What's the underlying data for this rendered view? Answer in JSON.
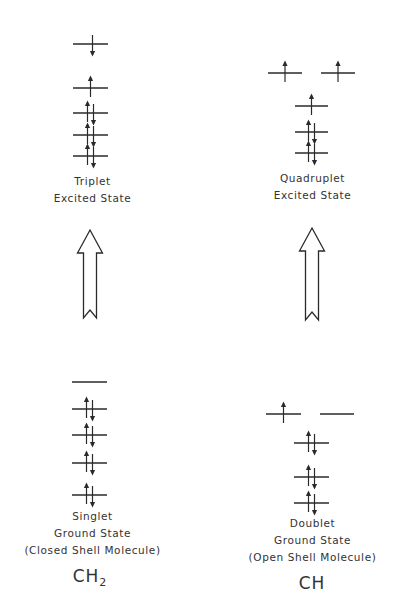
{
  "diagram": {
    "type": "energy-level electron configuration comparison",
    "line_color": "#2a2a2a",
    "columns": [
      {
        "molecule": "CH",
        "molecule_main": "CH",
        "molecule_sub": "2",
        "excited_state": {
          "label_lines": [
            "Triplet",
            "Excited State"
          ],
          "levels": [
            {
              "y": 44,
              "x1": 73,
              "x2": 108,
              "electrons": "down"
            },
            {
              "y": 88,
              "x1": 73,
              "x2": 108,
              "electrons": "up"
            },
            {
              "y": 113,
              "x1": 73,
              "x2": 108,
              "electrons": "pair"
            },
            {
              "y": 135,
              "x1": 73,
              "x2": 108,
              "electrons": "pair"
            },
            {
              "y": 156,
              "x1": 73,
              "x2": 108,
              "electrons": "pair"
            }
          ]
        },
        "transition_arrow": {
          "x": 90,
          "top": 230,
          "bottom": 318
        },
        "ground_state": {
          "label_lines": [
            "Singlet",
            "Ground State",
            "(Closed Shell Molecule)"
          ],
          "levels": [
            {
              "y": 382,
              "x1": 72,
              "x2": 107,
              "electrons": "empty"
            },
            {
              "y": 409,
              "x1": 72,
              "x2": 107,
              "electrons": "pair"
            },
            {
              "y": 435,
              "x1": 72,
              "x2": 107,
              "electrons": "pair"
            },
            {
              "y": 463,
              "x1": 72,
              "x2": 107,
              "electrons": "pair"
            },
            {
              "y": 495,
              "x1": 72,
              "x2": 107,
              "electrons": "pair"
            }
          ]
        }
      },
      {
        "molecule": "CH",
        "molecule_main": "CH",
        "molecule_sub": "",
        "excited_state": {
          "label_lines": [
            "Quadruplet",
            "Excited State"
          ],
          "levels": [
            {
              "y": 73,
              "x1": 268,
              "x2": 302,
              "electrons": "up"
            },
            {
              "y": 73,
              "x1": 321,
              "x2": 355,
              "electrons": "up"
            },
            {
              "y": 106,
              "x1": 295,
              "x2": 328,
              "electrons": "up"
            },
            {
              "y": 132,
              "x1": 295,
              "x2": 328,
              "electrons": "pair"
            },
            {
              "y": 153,
              "x1": 295,
              "x2": 328,
              "electrons": "pair"
            }
          ]
        },
        "transition_arrow": {
          "x": 312,
          "top": 228,
          "bottom": 320
        },
        "ground_state": {
          "label_lines": [
            "Doublet",
            "Ground State",
            "(Open Shell Molecule)"
          ],
          "levels": [
            {
              "y": 414,
              "x1": 266,
              "x2": 301,
              "electrons": "up"
            },
            {
              "y": 414,
              "x1": 320,
              "x2": 354,
              "electrons": "empty"
            },
            {
              "y": 443,
              "x1": 294,
              "x2": 329,
              "electrons": "pair"
            },
            {
              "y": 477,
              "x1": 294,
              "x2": 329,
              "electrons": "pair"
            },
            {
              "y": 503,
              "x1": 294,
              "x2": 329,
              "electrons": "pair"
            }
          ]
        }
      }
    ]
  }
}
